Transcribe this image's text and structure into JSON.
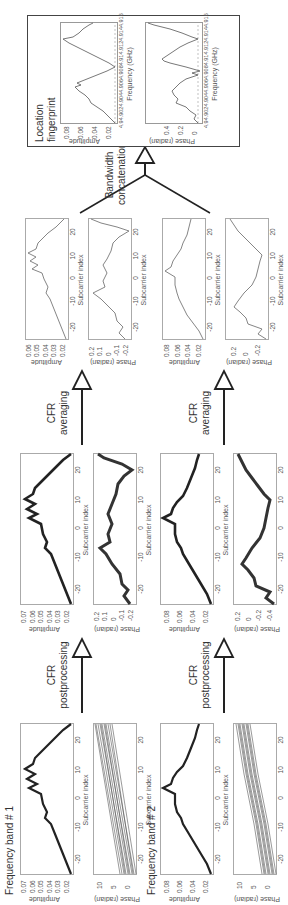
{
  "orientation": "rotated 90 degrees counter-clockwise on page",
  "bands": [
    {
      "title": "Frequency band # 1",
      "raw": {
        "amplitude": {
          "ylabel": "Amplitude",
          "yticks": [
            "0.07",
            "0.06",
            "0.05",
            "0.04",
            "0.03",
            "0.02"
          ]
        },
        "phase": {
          "ylabel": "Phase (radian)",
          "yticks": [
            "10",
            "5",
            "0"
          ]
        },
        "xlabel": "Subcarrier index",
        "xticks": [
          "-20",
          "-10",
          "0",
          "10",
          "20"
        ]
      },
      "post": {
        "amplitude": {
          "ylabel": "Amplitude",
          "yticks": [
            "0.07",
            "0.06",
            "0.05",
            "0.04",
            "0.03",
            "0.02"
          ]
        },
        "phase": {
          "ylabel": "Phase (radian)",
          "yticks": [
            "0.2",
            "0.1",
            "0",
            "-0.1",
            "-0.2"
          ]
        },
        "xlabel": "Subcarrier index",
        "xticks": [
          "-20",
          "-10",
          "0",
          "10",
          "20"
        ]
      },
      "avg": {
        "amplitude": {
          "ylabel": "Amplitude",
          "yticks": [
            "0.06",
            "0.05",
            "0.04",
            "0.03",
            "0.02"
          ]
        },
        "phase": {
          "ylabel": "Phase (radian)",
          "yticks": [
            "0.2",
            "0.1",
            "0",
            "-0.1",
            "-0.2"
          ]
        },
        "xlabel": "Subcarrier index",
        "xticks": [
          "-20",
          "-10",
          "0",
          "10",
          "20"
        ]
      }
    },
    {
      "title": "Frequency band # 2",
      "raw": {
        "amplitude": {
          "ylabel": "Amplitude",
          "yticks": [
            "0.08",
            "0.06",
            "0.04",
            "0.02"
          ]
        },
        "phase": {
          "ylabel": "Phase (radian)",
          "yticks": [
            "10",
            "5",
            "0"
          ]
        },
        "xlabel": "Subcarrier index",
        "xticks": [
          "-20",
          "-10",
          "0",
          "10",
          "20"
        ]
      },
      "post": {
        "amplitude": {
          "ylabel": "Amplitude",
          "yticks": [
            "0.08",
            "0.06",
            "0.04",
            "0.02"
          ]
        },
        "phase": {
          "ylabel": "Phase (radian)",
          "yticks": [
            "0.2",
            "0",
            "-0.2",
            "-0.4"
          ]
        },
        "xlabel": "Subcarrier index",
        "xticks": [
          "-20",
          "-10",
          "0",
          "10",
          "20"
        ]
      },
      "avg": {
        "amplitude": {
          "ylabel": "Amplitude",
          "yticks": [
            "0.08",
            "0.06",
            "0.04",
            "0.02"
          ]
        },
        "phase": {
          "ylabel": "Phase (radian)",
          "yticks": [
            "0.2",
            "0",
            "-0.2"
          ]
        },
        "xlabel": "Subcarrier index",
        "xticks": [
          "-20",
          "-10",
          "0",
          "10",
          "20"
        ]
      }
    }
  ],
  "steps": {
    "postprocessing": {
      "line1": "CFR",
      "line2": "postprocessing"
    },
    "averaging": {
      "line1": "CFR",
      "line2": "averaging"
    },
    "concatenation": {
      "line1": "Bandwidth",
      "line2": "concatenation"
    }
  },
  "fingerprint": {
    "title_line1": "Location",
    "title_line2": "fingerprint",
    "amplitude": {
      "ylabel": "Amplitude",
      "yticks": [
        "0.08",
        "0.06",
        "0.04",
        "0.02"
      ]
    },
    "phase": {
      "ylabel": "Phase (radian)",
      "yticks": [
        "0.4",
        "0.2",
        "0"
      ]
    },
    "xlabel": "Frequency (GHz)",
    "xticks": [
      "4.9",
      "4.902",
      "4.904",
      "4.906",
      "4.908",
      "4.91",
      "4.912",
      "4.914",
      "4.916"
    ]
  },
  "colors": {
    "line": "#222222",
    "thin_line": "#777777",
    "axis": "#aaaaaa",
    "arrow": "#222222"
  }
}
